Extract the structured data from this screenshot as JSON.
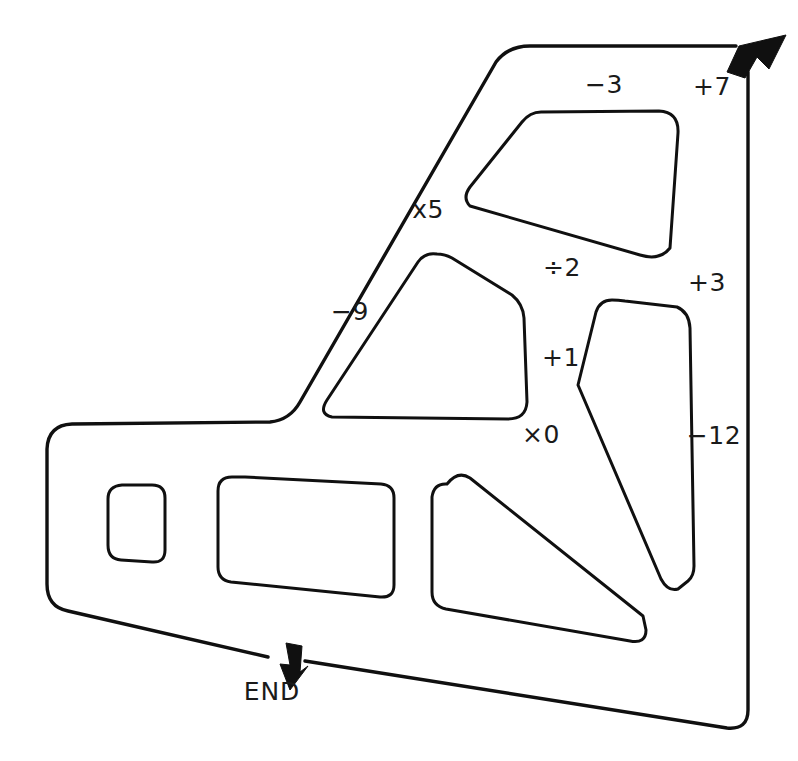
{
  "diagram": {
    "type": "maze-puzzle",
    "stroke_color": "#101010",
    "background_color": "#ffffff",
    "labels": [
      {
        "id": "minus-3",
        "text": "−3",
        "x": 604,
        "y": 93,
        "anchor": "middle"
      },
      {
        "id": "plus-7",
        "text": "+7",
        "x": 712,
        "y": 95,
        "anchor": "middle"
      },
      {
        "id": "times-5",
        "text": "x5",
        "x": 428,
        "y": 218,
        "anchor": "middle"
      },
      {
        "id": "divide-2",
        "text": "÷2",
        "x": 562,
        "y": 276,
        "anchor": "middle"
      },
      {
        "id": "plus-3",
        "text": "+3",
        "x": 707,
        "y": 291,
        "anchor": "middle"
      },
      {
        "id": "minus-9",
        "text": "−9",
        "x": 350,
        "y": 320,
        "anchor": "middle"
      },
      {
        "id": "plus-1",
        "text": "+1",
        "x": 561,
        "y": 366,
        "anchor": "middle"
      },
      {
        "id": "minus-12",
        "text": "−12",
        "x": 714,
        "y": 444,
        "anchor": "middle"
      },
      {
        "id": "times-0",
        "text": "×0",
        "x": 541,
        "y": 443,
        "anchor": "middle"
      }
    ],
    "end_marker": {
      "label": "END",
      "label_x": 272,
      "label_y": 700,
      "arrow_name": "end-arrow"
    },
    "start_marker": {
      "arrow_name": "start-arrow"
    }
  }
}
